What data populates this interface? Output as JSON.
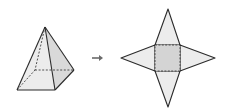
{
  "diagram": {
    "colors": {
      "stroke": "#2b2b2b",
      "face_light": "#ececec",
      "face_shade": "#dadada",
      "base_fill": "#d4d4d4",
      "arrow": "#6a6a6a",
      "background": "#ffffff"
    },
    "pyramid": {
      "apex": [
        45,
        27
      ],
      "front_left": [
        17,
        90
      ],
      "front_right": [
        55,
        90
      ],
      "back_right": [
        74,
        70
      ],
      "back_left": [
        35,
        70
      ]
    },
    "arrow": {
      "glyph": "→",
      "x": 97,
      "y": 58
    },
    "net": {
      "square": [
        [
          155,
          45
        ],
        [
          180,
          45
        ],
        [
          180,
          71
        ],
        [
          155,
          71
        ]
      ],
      "top_tip": [
        168,
        9
      ],
      "right_tip": [
        215,
        58
      ],
      "bottom_tip": [
        168,
        107
      ],
      "left_tip": [
        121,
        58
      ]
    }
  }
}
